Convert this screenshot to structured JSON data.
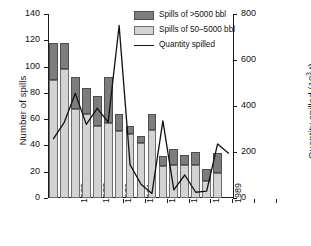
{
  "chart_data": {
    "type": "bar",
    "title": "",
    "subtitle": "",
    "xlabel": "",
    "ylabel": "Number of spills",
    "y2label": "Quantity spilled (10³ t)",
    "ylim": [
      0,
      140
    ],
    "y2lim": [
      0,
      800
    ],
    "yticks": [
      0,
      20,
      40,
      60,
      80,
      100,
      120,
      140
    ],
    "y2ticks": [
      0,
      200,
      400,
      600,
      800
    ],
    "grid": false,
    "legend_position": "top-right",
    "bar_style": "stacked",
    "categories": [
      "1973",
      "1974",
      "1975",
      "1976",
      "1977",
      "1978",
      "1979",
      "1980",
      "1981",
      "1982",
      "1983",
      "1984",
      "1985",
      "1986",
      "1987",
      "1988",
      "1989"
    ],
    "xtick_labels": [
      "1975",
      "1977",
      "1979",
      "1981",
      "1983",
      "1985",
      "1987",
      "1989"
    ],
    "xtick_categories": [
      "1975",
      "1977",
      "1979",
      "1981",
      "1983",
      "1985",
      "1987",
      "1989"
    ],
    "series": [
      {
        "name": "Spills of 50–5000 bbl",
        "axis": "left",
        "color": "#d3d3d3",
        "values": [
          90,
          98,
          68,
          64,
          55,
          57,
          51,
          49,
          42,
          52,
          24,
          25,
          25,
          25,
          13,
          19,
          0
        ]
      },
      {
        "name": "Spills of >5000 bbl",
        "axis": "left",
        "color": "#7d7d7d",
        "values": [
          28,
          20,
          24,
          20,
          23,
          35,
          13,
          6,
          5,
          12,
          8,
          12,
          8,
          10,
          9,
          15,
          0
        ]
      },
      {
        "name": "Quantity spilled",
        "axis": "right",
        "type": "line",
        "color": "#111111",
        "values": [
          258,
          330,
          455,
          320,
          390,
          330,
          750,
          145,
          60,
          20,
          335,
          35,
          100,
          25,
          30,
          235,
          195
        ]
      }
    ],
    "totals_left_axis": [
      118,
      118,
      92,
      84,
      78,
      92,
      64,
      55,
      47,
      64,
      32,
      37,
      33,
      35,
      22,
      34,
      0
    ]
  },
  "legend": {
    "items": [
      {
        "label": "Spills of >5000 bbl",
        "marker": "swatch-dark"
      },
      {
        "label": "Spills of 50–5000 bbl",
        "marker": "swatch-light"
      },
      {
        "label": "Quantity spilled",
        "marker": "line"
      }
    ]
  },
  "axes": {
    "left_title": "Number of spills",
    "right_title_main": "Quantity spilled (10",
    "right_title_sup": "3",
    "right_title_tail": " t)",
    "left_ticks": [
      "0",
      "20",
      "40",
      "60",
      "80",
      "100",
      "120",
      "140"
    ],
    "right_ticks": [
      "0",
      "200",
      "400",
      "600",
      "800"
    ]
  },
  "colors": {
    "bar_high": "#7d7d7d",
    "bar_low": "#d3d3d3",
    "line": "#111111",
    "axis": "#1a1a1a",
    "background": "#ffffff"
  }
}
